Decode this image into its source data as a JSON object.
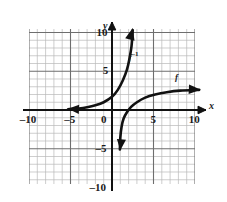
{
  "figure": {
    "kind": "coordinate-plane-graph",
    "background": "#ffffff",
    "grid_color": "#b9b9b9",
    "major_grid_color": "#6e6e6e",
    "axis_color": "#111111",
    "curve_color": "#111111"
  },
  "axes": {
    "x_label": "x",
    "y_label": "y",
    "x_ticks": [
      {
        "value": -10,
        "label": "–10"
      },
      {
        "value": -5,
        "label": "–5"
      },
      {
        "value": 5,
        "label": "5"
      },
      {
        "value": 10,
        "label": "10"
      }
    ],
    "y_ticks": [
      {
        "value": 10,
        "label": "10"
      },
      {
        "value": 5,
        "label": "5"
      },
      {
        "value": -5,
        "label": "–5"
      },
      {
        "value": -10,
        "label": "–10"
      }
    ],
    "origin_label": "0",
    "xlim": [
      -11,
      11
    ],
    "ylim": [
      -11,
      11
    ],
    "grid": true,
    "grid_step": 1,
    "major_grid_step": 5
  },
  "curve_labels": {
    "inverse": {
      "base": "f",
      "exponent": "–1",
      "text": "f–1"
    },
    "function": {
      "base": "f",
      "text": "f"
    }
  },
  "chart_data": {
    "type": "line",
    "title": "",
    "xlabel": "x",
    "ylabel": "y",
    "xlim": [
      -11,
      11
    ],
    "ylim": [
      -11,
      11
    ],
    "grid": true,
    "legend": "inline-labels",
    "series": [
      {
        "name": "f–1",
        "description": "exponential-like curve, horizontal asymptote y=0, rises steeply",
        "label_position": {
          "x": 2.0,
          "y": 7.0
        },
        "arrow_start": {
          "x": -5.3,
          "y": 0.15
        },
        "arrow_end": {
          "x": 2.5,
          "y": 10.6
        },
        "points": [
          {
            "x": -5.3,
            "y": 0.1
          },
          {
            "x": -4.0,
            "y": 0.2
          },
          {
            "x": -3.0,
            "y": 0.35
          },
          {
            "x": -2.0,
            "y": 0.6
          },
          {
            "x": -1.0,
            "y": 1.0
          },
          {
            "x": 0.0,
            "y": 1.7
          },
          {
            "x": 0.7,
            "y": 2.6
          },
          {
            "x": 1.3,
            "y": 3.8
          },
          {
            "x": 1.8,
            "y": 5.2
          },
          {
            "x": 2.1,
            "y": 6.6
          },
          {
            "x": 2.35,
            "y": 8.2
          },
          {
            "x": 2.5,
            "y": 10.3
          }
        ]
      },
      {
        "name": "f",
        "description": "logarithmic-like curve, vertical asymptote x=1, increases slowly",
        "label_position": {
          "x": 7.6,
          "y": 4.1
        },
        "arrow_start": {
          "x": 1.0,
          "y": -5.2
        },
        "arrow_end": {
          "x": 10.7,
          "y": 2.6
        },
        "points": [
          {
            "x": 0.95,
            "y": -5.1
          },
          {
            "x": 1.0,
            "y": -3.6
          },
          {
            "x": 1.15,
            "y": -2.2
          },
          {
            "x": 1.4,
            "y": -1.1
          },
          {
            "x": 1.8,
            "y": -0.3
          },
          {
            "x": 2.3,
            "y": 0.4
          },
          {
            "x": 3.0,
            "y": 1.0
          },
          {
            "x": 4.0,
            "y": 1.6
          },
          {
            "x": 5.2,
            "y": 2.0
          },
          {
            "x": 6.6,
            "y": 2.3
          },
          {
            "x": 8.2,
            "y": 2.5
          },
          {
            "x": 10.5,
            "y": 2.6
          }
        ]
      }
    ]
  }
}
